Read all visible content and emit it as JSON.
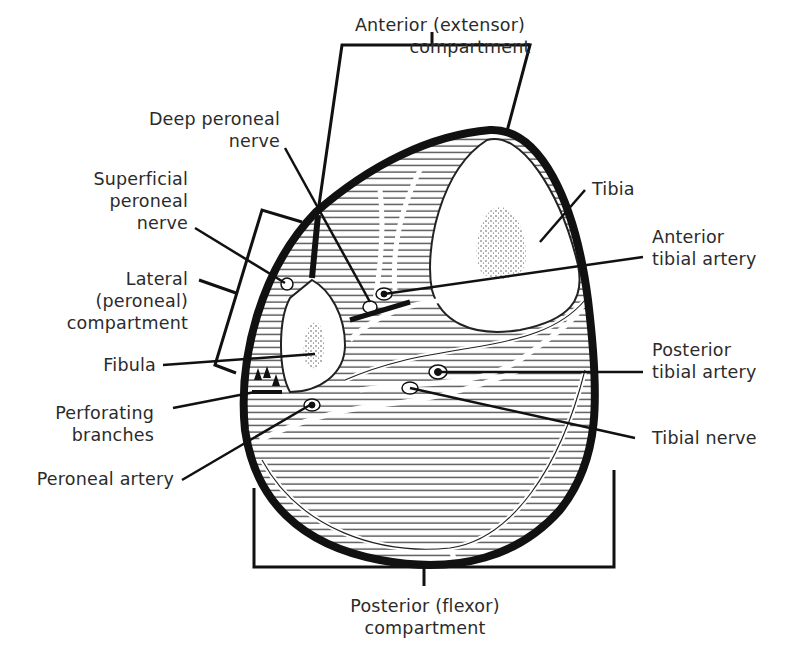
{
  "diagram": {
    "type": "anatomical cross-section",
    "colors": {
      "ink": "#111111",
      "text": "#2b2b2b",
      "background": "#ffffff"
    }
  },
  "labels": {
    "anterior_compartment": {
      "line1": "Anterior (extensor)",
      "line2": "compartment"
    },
    "deep_peroneal_nerve": {
      "line1": "Deep peroneal",
      "line2": "nerve"
    },
    "superficial_peroneal_nerve": {
      "line1": "Superficial",
      "line2": "peroneal",
      "line3": "nerve"
    },
    "lateral_compartment": {
      "line1": "Lateral",
      "line2": "(peroneal)",
      "line3": "compartment"
    },
    "fibula": {
      "line1": "Fibula"
    },
    "perforating_branches": {
      "line1": "Perforating",
      "line2": "branches"
    },
    "peroneal_artery": {
      "line1": "Peroneal artery"
    },
    "tibia": {
      "line1": "Tibia"
    },
    "anterior_tibial_artery": {
      "line1": "Anterior",
      "line2": "tibial artery"
    },
    "posterior_tibial_artery": {
      "line1": "Posterior",
      "line2": "tibial artery"
    },
    "tibial_nerve": {
      "line1": "Tibial nerve"
    },
    "posterior_compartment": {
      "line1": "Posterior (flexor)",
      "line2": "compartment"
    }
  }
}
